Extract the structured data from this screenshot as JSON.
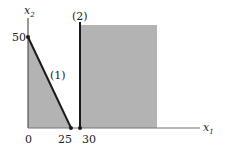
{
  "diagram": {
    "type": "linear-programming-feasible-region",
    "axes": {
      "x_label": "x",
      "x_sub": "1",
      "y_label": "x",
      "y_sub": "2"
    },
    "ticks": {
      "origin": "0",
      "x": [
        "25",
        "30"
      ],
      "y": [
        "50"
      ]
    },
    "constraints": [
      {
        "id": "1",
        "label": "(1)",
        "line": {
          "x_intercept": 25,
          "y_intercept": 50
        }
      },
      {
        "id": "2",
        "label": "(2)",
        "line": {
          "x": 30
        }
      }
    ],
    "regions": [
      {
        "name": "triangle region under (1)",
        "vertices": [
          [
            0,
            0
          ],
          [
            0,
            50
          ],
          [
            25,
            0
          ]
        ]
      },
      {
        "name": "region right of (2)",
        "x_min": 30
      }
    ],
    "colors": {
      "shade": "#b3b3b3",
      "line": "#1a1a1a",
      "axis": "#555555"
    }
  }
}
